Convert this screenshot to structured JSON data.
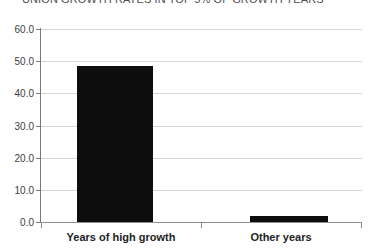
{
  "chart_data": {
    "type": "bar",
    "title": "UNION GROWTH RATES IN TOP 5% OF GROWTH YEARS",
    "xlabel": "",
    "ylabel": "",
    "categories": [
      "Years of high growth",
      "Other years"
    ],
    "values": [
      48.5,
      2.0
    ],
    "ylim": [
      0.0,
      60.0
    ],
    "ytick_labels": [
      "0.0",
      "10.0",
      "20.0",
      "30.0",
      "40.0",
      "50.0",
      "60.0"
    ],
    "ytick_values": [
      0.0,
      10.0,
      20.0,
      30.0,
      40.0,
      50.0,
      60.0
    ],
    "grid": true,
    "legend": false,
    "series": [
      {
        "name": "Union growth rate",
        "values": [
          48.5,
          2.0
        ],
        "color": "#0d0d0d"
      }
    ],
    "colors": {
      "bar": "#0d0d0d",
      "gridline": "#d4d4d4",
      "axis": "#8f8f8f",
      "background": "#ffffff",
      "title_text": "#4d4d4d",
      "tick_text": "#3d3d3d",
      "category_text": "#232323"
    }
  }
}
